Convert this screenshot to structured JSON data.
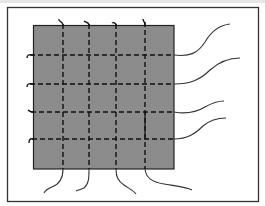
{
  "diagram": {
    "type": "wire-grid-panel",
    "colors": {
      "background": "#ffffff",
      "frame": "#333333",
      "panel_fill": "#8c8c8c",
      "panel_border": "#222222",
      "wire": "#111111",
      "lead": "#333333"
    },
    "frame": {
      "x": 7,
      "y": 7,
      "width": 251,
      "height": 194
    },
    "panel": {
      "x": 33,
      "y": 25,
      "width": 141,
      "height": 144
    },
    "vertical_wires": [
      {
        "x": 63,
        "lead_end": [
          44,
          193
        ],
        "hook": "top"
      },
      {
        "x": 89,
        "lead_end": [
          76,
          191
        ],
        "hook": "top"
      },
      {
        "x": 116,
        "lead_end": [
          136,
          194
        ],
        "hook": "top"
      },
      {
        "x": 145,
        "lead_end": [
          192,
          190
        ],
        "hook": "top"
      }
    ],
    "horizontal_wires": [
      {
        "y": 55,
        "lead_end": [
          230,
          24
        ],
        "hook": "left"
      },
      {
        "y": 84,
        "lead_end": [
          240,
          58
        ],
        "hook": "left"
      },
      {
        "y": 112,
        "lead_end": [
          224,
          101
        ],
        "hook": "left"
      },
      {
        "y": 139,
        "lead_end": [
          226,
          118
        ],
        "hook": "left"
      }
    ],
    "grid_size": "4x4"
  }
}
